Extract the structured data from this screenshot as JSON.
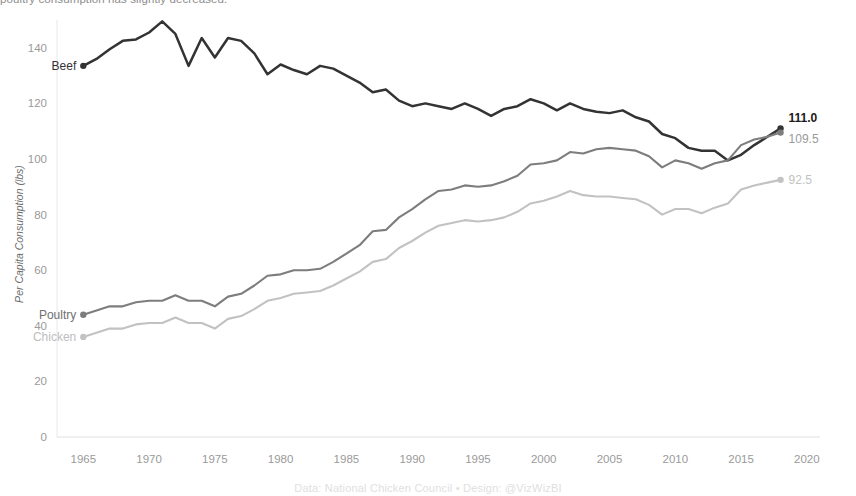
{
  "subtitle_clipped": "poultry consumption has slightly decreased.",
  "caption": "Data: National Chicken Council • Design: @VizWizBI",
  "axis": {
    "ylabel": "Per Capita Consumption (lbs)",
    "yticks": [
      "0",
      "20",
      "40",
      "60",
      "80",
      "100",
      "120",
      "140"
    ],
    "xticks": [
      "1965",
      "1970",
      "1975",
      "1980",
      "1985",
      "1990",
      "1995",
      "2000",
      "2005",
      "2010",
      "2015",
      "2020"
    ]
  },
  "series_labels": {
    "beef": "Beef",
    "poultry": "Poultry",
    "chicken": "Chicken"
  },
  "end_labels": {
    "beef": "111.0",
    "poultry": "109.5",
    "chicken": "92.5"
  },
  "colors": {
    "beef": "#333333",
    "poultry": "#7d7d7d",
    "chicken": "#c2c2c2",
    "axis": "#e3e3e3",
    "tick_text": "#9a9a9a",
    "caption": "#e0e0e0"
  },
  "chart_data": {
    "type": "line",
    "title": "",
    "subtitle": "poultry consumption has slightly decreased.",
    "xlabel": "",
    "ylabel": "Per Capita Consumption (lbs)",
    "xlim": [
      1963,
      2021
    ],
    "ylim": [
      0,
      150
    ],
    "yticks": [
      0,
      20,
      40,
      60,
      80,
      100,
      120,
      140
    ],
    "xticks": [
      1965,
      1970,
      1975,
      1980,
      1985,
      1990,
      1995,
      2000,
      2005,
      2010,
      2015,
      2020
    ],
    "grid": false,
    "legend": "inline-endpoint-labels",
    "x": [
      1965,
      1966,
      1967,
      1968,
      1969,
      1970,
      1971,
      1972,
      1973,
      1974,
      1975,
      1976,
      1977,
      1978,
      1979,
      1980,
      1981,
      1982,
      1983,
      1984,
      1985,
      1986,
      1987,
      1988,
      1989,
      1990,
      1991,
      1992,
      1993,
      1994,
      1995,
      1996,
      1997,
      1998,
      1999,
      2000,
      2001,
      2002,
      2003,
      2004,
      2005,
      2006,
      2007,
      2008,
      2009,
      2010,
      2011,
      2012,
      2013,
      2014,
      2015,
      2016,
      2017,
      2018
    ],
    "series": [
      {
        "name": "Beef",
        "color": "#333333",
        "end_label": "111.0",
        "start_label": "Beef",
        "values": [
          133.5,
          136.0,
          139.5,
          142.5,
          143.0,
          145.5,
          149.5,
          145.0,
          133.5,
          143.5,
          136.5,
          143.5,
          142.5,
          138.0,
          130.5,
          134.0,
          132.0,
          130.5,
          133.5,
          132.5,
          130.0,
          127.5,
          124.0,
          125.0,
          121.0,
          119.0,
          120.0,
          119.0,
          118.0,
          120.0,
          118.0,
          115.5,
          118.0,
          119.0,
          121.5,
          120.0,
          117.5,
          120.0,
          118.0,
          117.0,
          116.5,
          117.5,
          115.0,
          113.5,
          109.0,
          107.5,
          104.0,
          103.0,
          103.0,
          99.5,
          101.5,
          105.0,
          108.0,
          111.0
        ]
      },
      {
        "name": "Poultry",
        "color": "#7d7d7d",
        "end_label": "109.5",
        "start_label": "Poultry",
        "values": [
          44.0,
          45.5,
          47.0,
          47.0,
          48.5,
          49.0,
          49.0,
          51.0,
          49.0,
          49.0,
          47.0,
          50.5,
          51.5,
          54.5,
          58.0,
          58.5,
          60.0,
          60.0,
          60.5,
          63.0,
          66.0,
          69.0,
          74.0,
          74.5,
          79.0,
          82.0,
          85.5,
          88.5,
          89.0,
          90.5,
          90.0,
          90.5,
          92.0,
          94.0,
          98.0,
          98.5,
          99.5,
          102.5,
          102.0,
          103.5,
          104.0,
          103.5,
          103.0,
          101.0,
          97.0,
          99.5,
          98.5,
          96.5,
          98.5,
          99.5,
          105.0,
          107.0,
          108.0,
          109.5
        ]
      },
      {
        "name": "Chicken",
        "color": "#c2c2c2",
        "end_label": "92.5",
        "start_label": "Chicken",
        "values": [
          36.0,
          37.5,
          39.0,
          39.0,
          40.5,
          41.0,
          41.0,
          43.0,
          41.0,
          41.0,
          39.0,
          42.5,
          43.5,
          46.0,
          49.0,
          50.0,
          51.5,
          52.0,
          52.5,
          54.5,
          57.0,
          59.5,
          63.0,
          64.0,
          68.0,
          70.5,
          73.5,
          76.0,
          77.0,
          78.0,
          77.5,
          78.0,
          79.0,
          81.0,
          84.0,
          85.0,
          86.5,
          88.5,
          87.0,
          86.5,
          86.5,
          86.0,
          85.5,
          83.5,
          80.0,
          82.0,
          82.0,
          80.5,
          82.5,
          84.0,
          89.0,
          90.5,
          91.5,
          92.5
        ]
      }
    ]
  }
}
